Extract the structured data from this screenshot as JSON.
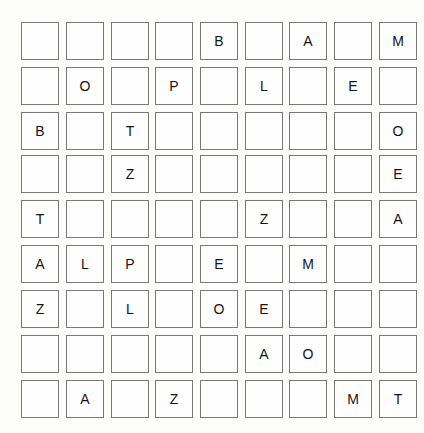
{
  "board": {
    "title": "letter-grid-puzzle",
    "rows": 9,
    "cols": 9,
    "block_rows": 3,
    "block_cols": 3,
    "colors": {
      "background": "#fdfdfb",
      "cell_fill": "#fefefe",
      "cell_border": "#787878",
      "letter": "#141414"
    },
    "blank_cell": "",
    "blocks": [
      [
        {
          "id": "block-r1c1",
          "cells": [
            [
              "",
              "",
              ""
            ],
            [
              "",
              "O",
              ""
            ],
            [
              "B",
              "",
              "T"
            ]
          ]
        },
        {
          "id": "block-r1c2",
          "cells": [
            [
              "",
              "B",
              ""
            ],
            [
              "P",
              "",
              "L"
            ],
            [
              "",
              "",
              ""
            ]
          ]
        },
        {
          "id": "block-r1c3",
          "cells": [
            [
              "A",
              "",
              "M"
            ],
            [
              "",
              "E",
              ""
            ],
            [
              "",
              "",
              "O"
            ]
          ]
        }
      ],
      [
        {
          "id": "block-r2c1",
          "cells": [
            [
              "",
              "",
              "Z"
            ],
            [
              "T",
              "",
              ""
            ],
            [
              "A",
              "L",
              "P"
            ]
          ]
        },
        {
          "id": "block-r2c2",
          "cells": [
            [
              "",
              "",
              ""
            ],
            [
              "",
              "",
              "Z"
            ],
            [
              "",
              "E",
              ""
            ]
          ]
        },
        {
          "id": "block-r2c3",
          "cells": [
            [
              "",
              "",
              "E"
            ],
            [
              "",
              "",
              "A"
            ],
            [
              "M",
              "",
              ""
            ]
          ]
        }
      ],
      [
        {
          "id": "block-r3c1",
          "cells": [
            [
              "Z",
              "",
              "L"
            ],
            [
              "",
              "",
              ""
            ],
            [
              "",
              "A",
              ""
            ]
          ]
        },
        {
          "id": "block-r3c2",
          "cells": [
            [
              "",
              "O",
              "E"
            ],
            [
              "",
              "",
              "A"
            ],
            [
              "Z",
              "",
              ""
            ]
          ]
        },
        {
          "id": "block-r3c3",
          "cells": [
            [
              "",
              "",
              ""
            ],
            [
              "O",
              "",
              ""
            ],
            [
              "",
              "M",
              "T"
            ]
          ]
        }
      ]
    ]
  }
}
